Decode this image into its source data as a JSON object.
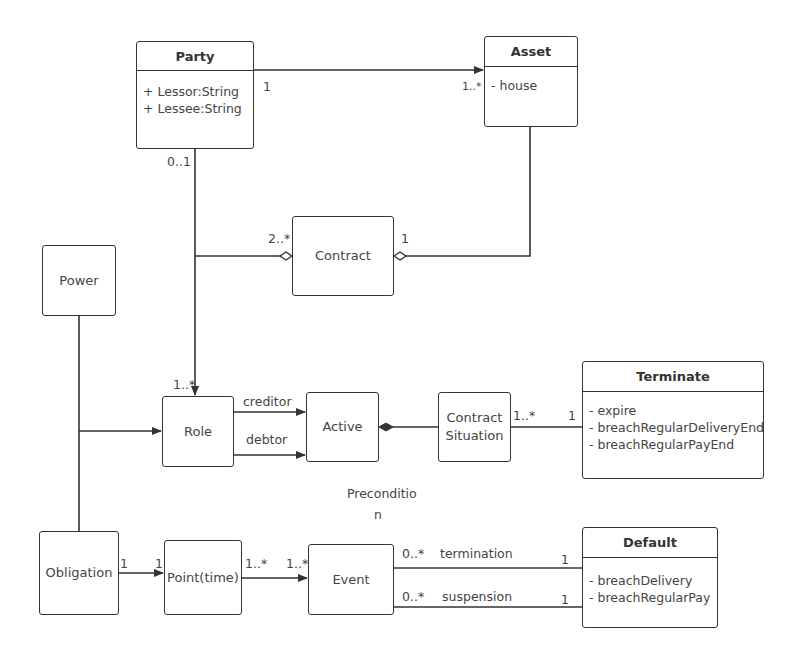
{
  "classes": {
    "party": {
      "name": "Party",
      "attributes": [
        "+ Lessor:String",
        "+ Lessee:String"
      ]
    },
    "asset": {
      "name": "Asset",
      "attributes": [
        "- house"
      ]
    },
    "contract": {
      "name": "Contract"
    },
    "power": {
      "name": "Power"
    },
    "role": {
      "name": "Role"
    },
    "active": {
      "name": "Active"
    },
    "contract_situation": {
      "name": "Contract Situation",
      "line1": "Contract",
      "line2": "Situation"
    },
    "terminate": {
      "name": "Terminate",
      "attributes": [
        "- expire",
        "- breachRegularDeliveryEnd",
        "- breachRegularPayEnd"
      ]
    },
    "obligation": {
      "name": "Obligation"
    },
    "point_time": {
      "name": "Point(time)"
    },
    "event": {
      "name": "Event"
    },
    "default": {
      "name": "Default",
      "attributes": [
        "- breachDelivery",
        "- breachRegularPay"
      ]
    }
  },
  "labels": {
    "party_asset_src": "1",
    "party_asset_dst": "1..*",
    "party_role_src": "0..1",
    "contract_party": "2..*",
    "contract_asset": "1",
    "role_mult": "1..*",
    "creditor": "creditor",
    "debtor": "debtor",
    "situation_src": "1..*",
    "situation_dst": "1",
    "precondition_line1": "Preconditio",
    "precondition_line2": "n",
    "obligation_src": "1",
    "point_dst": "1",
    "point_src": "1..*",
    "event_dst": "1..*",
    "termination_src": "0..*",
    "termination": "termination",
    "termination_dst": "1",
    "suspension_src": "0..*",
    "suspension": "suspension",
    "suspension_dst": "1"
  },
  "colors": {
    "line": "#333333",
    "text": "#444444",
    "background": "#ffffff"
  }
}
